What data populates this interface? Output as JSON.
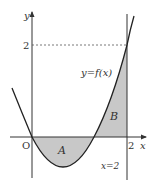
{
  "labels": {
    "y_axis": "y",
    "x_axis": "x",
    "origin": "O",
    "y_tick": "2",
    "x_tick": "2",
    "function": "y=f(x)",
    "region_a": "A",
    "region_b": "B",
    "vertical_line": "x=2"
  },
  "colors": {
    "shade": "#c8c8c8",
    "line": "#222222"
  }
}
